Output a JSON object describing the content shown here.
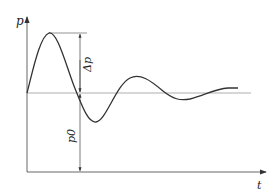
{
  "diagram": {
    "type": "damped-oscillation-pressure-time",
    "axes": {
      "y_label": "p",
      "x_label": "t"
    },
    "annotations": {
      "amplitude_label": "Δp",
      "baseline_label": "p0"
    },
    "colors": {
      "curve": "#333333",
      "axis": "#555555",
      "baseline": "#888888",
      "dimension": "#444444"
    }
  }
}
